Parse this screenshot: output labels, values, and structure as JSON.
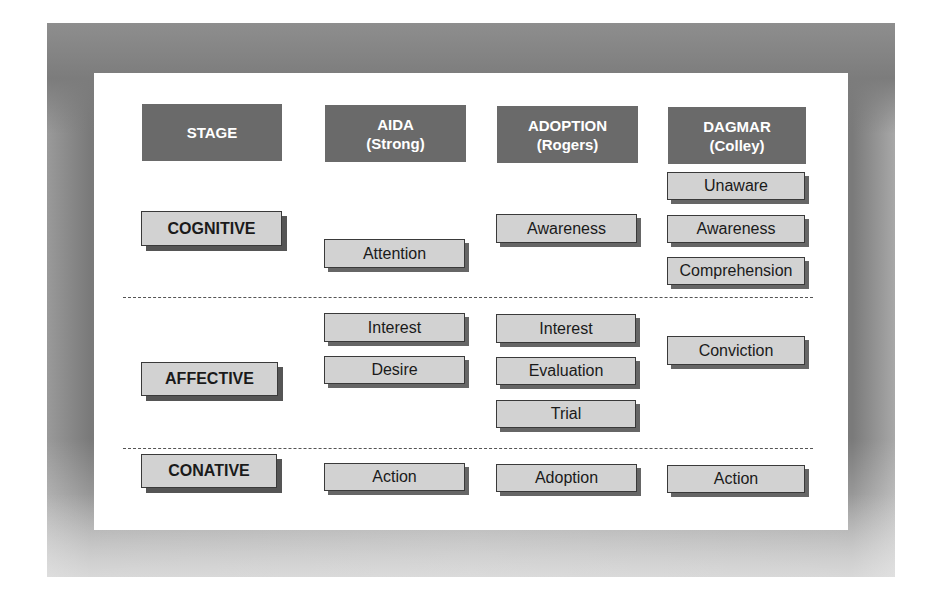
{
  "headers": {
    "stage": "STAGE",
    "aida": {
      "line1": "AIDA",
      "line2": "(Strong)"
    },
    "adoption": {
      "line1": "ADOPTION",
      "line2": "(Rogers)"
    },
    "dagmar": {
      "line1": "DAGMAR",
      "line2": "(Colley)"
    }
  },
  "stages": {
    "cognitive": "COGNITIVE",
    "affective": "AFFECTIVE",
    "conative": "CONATIVE"
  },
  "aida": {
    "cognitive": [
      "Attention"
    ],
    "affective": [
      "Interest",
      "Desire"
    ],
    "conative": [
      "Action"
    ]
  },
  "adoption": {
    "cognitive": [
      "Awareness"
    ],
    "affective": [
      "Interest",
      "Evaluation",
      "Trial"
    ],
    "conative": [
      "Adoption"
    ]
  },
  "dagmar": {
    "cognitive": [
      "Unaware",
      "Awareness",
      "Comprehension"
    ],
    "affective": [
      "Conviction"
    ],
    "conative": [
      "Action"
    ]
  },
  "colors": {
    "header_bg": "#6a6a6a",
    "box_bg": "#d2d2d2",
    "frame": "#808080"
  }
}
